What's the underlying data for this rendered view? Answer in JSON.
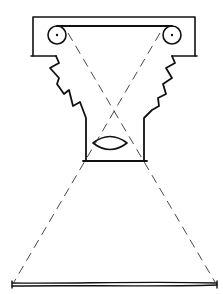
{
  "diagram": {
    "colors": {
      "ink": "#111111",
      "dashed_rays": "#333333",
      "background": "#ffffff"
    },
    "components": [
      {
        "name": "reel-housing",
        "shape": "rectangle"
      },
      {
        "name": "left-reel",
        "shape": "circle"
      },
      {
        "name": "right-reel",
        "shape": "circle"
      },
      {
        "name": "film-strip",
        "shape": "line"
      },
      {
        "name": "bellows",
        "shape": "zigzag"
      },
      {
        "name": "lens-housing",
        "shape": "rectangle"
      },
      {
        "name": "lens",
        "shape": "ellipse"
      },
      {
        "name": "projection-rays",
        "shape": "dashed-lines"
      },
      {
        "name": "projection-screen",
        "shape": "line"
      }
    ]
  }
}
